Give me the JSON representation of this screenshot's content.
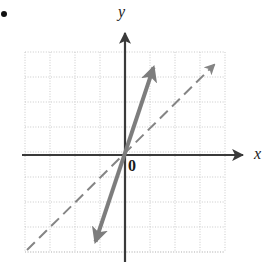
{
  "figure": {
    "bullet_marker": "•",
    "origin_label": "0",
    "x_axis_label": "x",
    "y_axis_label": "y",
    "width_px": 267,
    "height_px": 263
  },
  "colors": {
    "background": "#ffffff",
    "axis": "#3a3a3a",
    "grid": "#c9c9c9",
    "solid_line": "#7d7d7d",
    "dashed_line": "#858585",
    "text": "#1a1a1a",
    "bullet": "#111111"
  },
  "chart_data": {
    "type": "line",
    "title": "",
    "subtitle": "",
    "xlabel": "x",
    "ylabel": "y",
    "annotations": [
      "0"
    ],
    "grid": true,
    "grid_style": "dotted",
    "legend": false,
    "legend_position": "none",
    "xlim": [
      -4,
      4
    ],
    "ylim": [
      -4,
      4
    ],
    "x_ticks": [
      -4,
      -3,
      -2,
      -1,
      0,
      1,
      2,
      3,
      4
    ],
    "y_ticks": [
      -4,
      -3,
      -2,
      -1,
      0,
      1,
      2,
      3,
      4
    ],
    "x_tick_labels": [
      "",
      "",
      "",
      "",
      "0",
      "",
      "",
      "",
      ""
    ],
    "y_tick_labels": [
      "",
      "",
      "",
      "",
      "",
      "",
      "",
      "",
      ""
    ],
    "series": [
      {
        "name": "solid-line",
        "style": "solid",
        "color": "#7d7d7d",
        "width_px": 4,
        "arrows": "both",
        "slope": 3,
        "intercept": 0,
        "x": [
          -1.32,
          1.28
        ],
        "y": [
          -3.96,
          3.84
        ],
        "points_px": [
          [
            92,
            252
          ],
          [
            157,
            57
          ]
        ]
      },
      {
        "name": "dashed-line",
        "style": "dashed",
        "color": "#858585",
        "width_px": 2,
        "arrows": "end",
        "slope": 1,
        "intercept": 0,
        "x": [
          -3.92,
          3.88
        ],
        "y": [
          -3.8,
          3.92
        ],
        "points_px": [
          [
            27,
            250
          ],
          [
            222,
            57
          ]
        ]
      }
    ],
    "axes_px": {
      "origin": [
        125,
        155
      ],
      "x_axis": [
        [
          22,
          155
        ],
        [
          248,
          155
        ]
      ],
      "y_axis": [
        [
          125,
          262
        ],
        [
          125,
          28
        ]
      ],
      "grid_left": 25,
      "grid_right": 225,
      "grid_top": 52,
      "grid_bottom": 252,
      "grid_spacing": 25
    }
  }
}
